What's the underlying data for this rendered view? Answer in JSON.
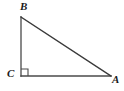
{
  "figure": {
    "kind": "right-triangle-diagram",
    "background_color": "#ffffff",
    "stroke_color": "#4a4a4a",
    "label_color": "#1a1a1a",
    "stroke_width": 1.3,
    "right_angle_vertex": "C",
    "vertices": [
      {
        "name": "B",
        "label": "B",
        "x": 21,
        "y": 17
      },
      {
        "name": "C",
        "label": "C",
        "x": 21,
        "y": 76
      },
      {
        "name": "A",
        "label": "A",
        "x": 111,
        "y": 76
      }
    ],
    "edges": [
      {
        "name": "leg-CB",
        "from": "C",
        "to": "B"
      },
      {
        "name": "leg-CA",
        "from": "C",
        "to": "A"
      },
      {
        "name": "hypotenuse-BA",
        "from": "B",
        "to": "A"
      }
    ],
    "right_angle_marker": {
      "name": "right-angle-square",
      "x": 21,
      "y": 69,
      "size": 7
    }
  }
}
